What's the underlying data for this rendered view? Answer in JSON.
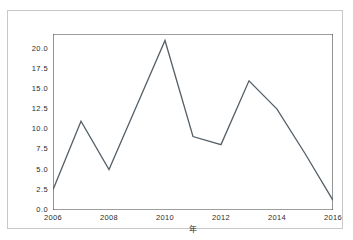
{
  "figure": {
    "caption": "",
    "border_color": "#c8c8c8"
  },
  "chart_data": {
    "type": "line",
    "title": "",
    "subtitle": "",
    "xlabel": "年",
    "ylabel": "",
    "x": [
      2006,
      2007,
      2008,
      2009,
      2010,
      2011,
      2012,
      2013,
      2014,
      2015,
      2016
    ],
    "values": [
      2.5,
      11.0,
      5.0,
      13.0,
      21.0,
      9.1,
      8.1,
      16.0,
      12.5,
      7.0,
      1.2
    ],
    "series": [
      {
        "name": "",
        "values": [
          2.5,
          11.0,
          5.0,
          13.0,
          21.0,
          9.1,
          8.1,
          16.0,
          12.5,
          7.0,
          1.2
        ]
      }
    ],
    "xlim": [
      2006,
      2016
    ],
    "ylim": [
      0.0,
      21.8
    ],
    "xticks": [
      2006,
      2008,
      2010,
      2012,
      2014,
      2016
    ],
    "xtick_labels": [
      "2006",
      "2008",
      "2010",
      "2012",
      "2014",
      "2016"
    ],
    "yticks": [
      0.0,
      2.5,
      5.0,
      7.5,
      10.0,
      12.5,
      15.0,
      17.5,
      20.0
    ],
    "ytick_labels": [
      "0.0",
      "2.5",
      "5.0",
      "7.5",
      "10.0",
      "12.5",
      "15.0",
      "17.5",
      "20.0"
    ],
    "grid": false,
    "legend": null,
    "line_color": "#555f66",
    "line_width": 1.3,
    "axis_color": "#3c3c3c",
    "markers": false
  }
}
